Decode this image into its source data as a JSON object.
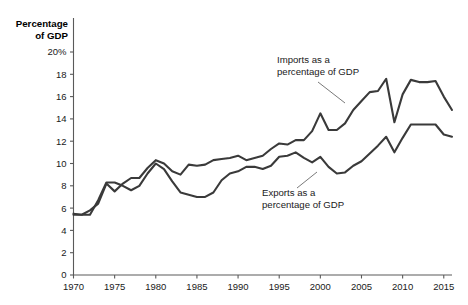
{
  "chart_data": {
    "type": "line",
    "title": "",
    "subtitle": "",
    "xlabel": "",
    "ylabel": "Percentage of GDP",
    "ylabel_line1": "Percentage",
    "ylabel_line2": "of GDP",
    "xlim": [
      1970,
      2016
    ],
    "ylim": [
      0,
      20
    ],
    "grid": false,
    "legend_position": "inline-annotations",
    "y_ticks": [
      0,
      2,
      4,
      6,
      8,
      10,
      12,
      14,
      16,
      18,
      20
    ],
    "y_tick_labels": [
      "0",
      "2",
      "4",
      "6",
      "8",
      "10",
      "12",
      "14",
      "16",
      "18",
      "20%"
    ],
    "x_ticks": [
      1970,
      1975,
      1980,
      1985,
      1990,
      1995,
      2000,
      2005,
      2010,
      2015
    ],
    "x_tick_labels": [
      "1970",
      "1975",
      "1980",
      "1985",
      "1990",
      "1995",
      "2000",
      "2005",
      "2010",
      "2015"
    ],
    "x": [
      1970,
      1971,
      1972,
      1973,
      1974,
      1975,
      1976,
      1977,
      1978,
      1979,
      1980,
      1981,
      1982,
      1983,
      1984,
      1985,
      1986,
      1987,
      1988,
      1989,
      1990,
      1991,
      1992,
      1993,
      1994,
      1995,
      1996,
      1997,
      1998,
      1999,
      2000,
      2001,
      2002,
      2003,
      2004,
      2005,
      2006,
      2007,
      2008,
      2009,
      2010,
      2011,
      2012,
      2013,
      2014,
      2015,
      2016
    ],
    "series": [
      {
        "name": "Imports as a percentage of GDP",
        "values": [
          5.4,
          5.4,
          5.8,
          6.4,
          8.2,
          7.5,
          8.2,
          8.7,
          8.7,
          9.6,
          10.3,
          10.0,
          9.3,
          9.0,
          9.9,
          9.8,
          9.9,
          10.3,
          10.4,
          10.5,
          10.7,
          10.3,
          10.5,
          10.7,
          11.3,
          11.8,
          11.7,
          12.1,
          12.1,
          12.9,
          14.5,
          13.0,
          13.0,
          13.6,
          14.8,
          15.6,
          16.4,
          16.5,
          17.6,
          13.7,
          16.2,
          17.5,
          17.3,
          17.3,
          17.4,
          16.0,
          14.8
        ],
        "label_text_line1": "Imports as a",
        "label_text_line2": "percentage of GDP"
      },
      {
        "name": "Exports as a percentage of GDP",
        "values": [
          5.5,
          5.4,
          5.4,
          6.7,
          8.3,
          8.3,
          8.0,
          7.6,
          8.0,
          9.1,
          10.0,
          9.5,
          8.4,
          7.4,
          7.2,
          7.0,
          7.0,
          7.4,
          8.5,
          9.1,
          9.3,
          9.7,
          9.7,
          9.5,
          9.8,
          10.6,
          10.7,
          11.0,
          10.5,
          10.1,
          10.6,
          9.7,
          9.1,
          9.2,
          9.8,
          10.2,
          10.9,
          11.6,
          12.4,
          11.0,
          12.3,
          13.5,
          13.5,
          13.5,
          13.5,
          12.6,
          12.4
        ],
        "label_text_line1": "Exports as a",
        "label_text_line2": "percentage of GDP"
      }
    ],
    "annotations": [
      {
        "name": "imports-annotation",
        "line1": "Imports as a",
        "line2": "percentage of GDP"
      },
      {
        "name": "exports-annotation",
        "line1": "Exports as a",
        "line2": "percentage of GDP"
      }
    ],
    "colors": {
      "line": "#3a3a3a",
      "axis": "#5a5a5a",
      "text": "#1a1a1a",
      "background": "#ffffff"
    }
  }
}
